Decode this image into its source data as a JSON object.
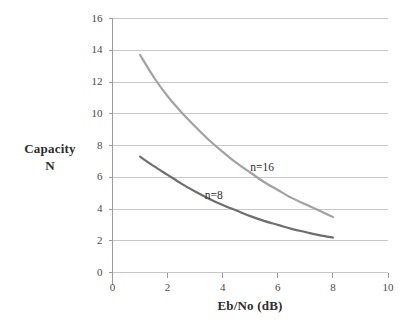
{
  "chart_data": {
    "type": "line",
    "title": "",
    "subtitle": "",
    "xlabel": "Eb/No (dB)",
    "ylabel": "Capacity N",
    "ylabel_lines": [
      "Capacity",
      "N"
    ],
    "xlim": [
      0,
      10
    ],
    "ylim": [
      0,
      16
    ],
    "xticks": [
      0,
      2,
      4,
      6,
      8,
      10
    ],
    "yticks": [
      0,
      2,
      4,
      6,
      8,
      10,
      12,
      14,
      16
    ],
    "xtick_labels": [
      "0",
      "2",
      "4",
      "6",
      "8",
      "10"
    ],
    "ytick_labels": [
      "0",
      "2",
      "4",
      "6",
      "8",
      "10",
      "12",
      "14",
      "16"
    ],
    "grid": {
      "horizontal": true,
      "vertical": false,
      "color": "#c8c8c8"
    },
    "legend": {
      "position": "inline-annotations",
      "entries": [
        "n=16",
        "n=8"
      ]
    },
    "series": [
      {
        "name": "n=16",
        "color": "#a2a2a2",
        "label_text": "n=16",
        "label_x": 5.0,
        "label_y": 6.6,
        "x": [
          1.0,
          1.5,
          2.0,
          2.5,
          3.0,
          3.5,
          4.0,
          4.5,
          5.0,
          5.5,
          6.0,
          6.5,
          7.0,
          7.5,
          8.0
        ],
        "values": [
          13.7,
          12.3,
          11.1,
          10.1,
          9.2,
          8.35,
          7.6,
          6.9,
          6.3,
          5.7,
          5.2,
          4.7,
          4.3,
          3.9,
          3.5
        ]
      },
      {
        "name": "n=8",
        "color": "#6e6e6e",
        "label_text": "n=8",
        "label_x": 3.35,
        "label_y": 4.85,
        "x": [
          1.0,
          1.5,
          2.0,
          2.5,
          3.0,
          3.5,
          4.0,
          4.5,
          5.0,
          5.5,
          6.0,
          6.5,
          7.0,
          7.5,
          8.0
        ],
        "values": [
          7.3,
          6.7,
          6.15,
          5.6,
          5.1,
          4.65,
          4.25,
          3.9,
          3.55,
          3.25,
          3.0,
          2.75,
          2.55,
          2.35,
          2.2
        ]
      }
    ]
  },
  "axes": {
    "y_title_line1": "Capacity",
    "y_title_line2": "N",
    "x_title": "Eb/No (dB)"
  },
  "colors": {
    "background": "#ffffff",
    "grid": "#c8c8c8",
    "axis": "#9a9a9a",
    "text": "#3a3a3a",
    "series_n16": "#a2a2a2",
    "series_n8": "#6e6e6e"
  }
}
